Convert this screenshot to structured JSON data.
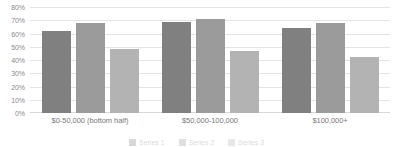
{
  "chart_data": {
    "type": "bar",
    "title": "",
    "subtitle": "",
    "xlabel": "",
    "ylabel": "",
    "ylim": [
      0,
      80
    ],
    "grid": true,
    "legend_position": "bottom",
    "y_ticks": [
      "0%",
      "10%",
      "20%",
      "30%",
      "40%",
      "50%",
      "60%",
      "70%",
      "80%"
    ],
    "y_tick_values": [
      0,
      10,
      20,
      30,
      40,
      50,
      60,
      70,
      80
    ],
    "categories": [
      "$0-50,000 (bottom half)",
      "$50,000-100,000",
      "$100,000+"
    ],
    "series": [
      {
        "name": "Series 1",
        "color": "#808080",
        "values": [
          62,
          69,
          64
        ]
      },
      {
        "name": "Series 2",
        "color": "#9b9b9b",
        "values": [
          68,
          71,
          68
        ]
      },
      {
        "name": "Series 3",
        "color": "#b3b3b3",
        "values": [
          48,
          47,
          42
        ]
      }
    ]
  }
}
